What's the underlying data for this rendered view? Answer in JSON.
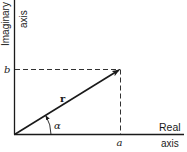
{
  "diagram": {
    "vertical_axis": {
      "label_line1": "Imaginary",
      "label_line2": "axis"
    },
    "horizontal_axis": {
      "label_line1": "Real",
      "label_line2": "axis"
    },
    "labels": {
      "imag_component": "b",
      "real_component": "a",
      "vector": "r",
      "angle": "α"
    },
    "colors": {
      "ink": "#1a1a1a",
      "background": "#ffffff"
    }
  }
}
